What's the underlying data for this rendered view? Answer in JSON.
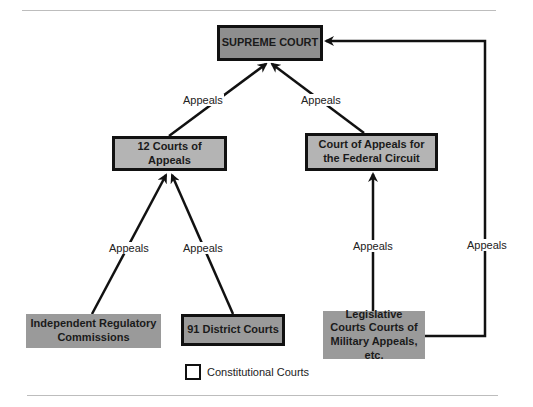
{
  "diagram": {
    "nodes": {
      "supreme": {
        "label": "SUPREME COURT",
        "constitutional": true
      },
      "courts_of_appeals": {
        "label": "12 Courts of Appeals",
        "constitutional": true
      },
      "federal_circuit": {
        "label": "Court of Appeals for the Federal Circuit",
        "constitutional": true
      },
      "regulatory": {
        "label": "Independent Regulatory Commissions",
        "constitutional": false
      },
      "district": {
        "label": "91 District Courts",
        "constitutional": true
      },
      "legislative": {
        "label": "Legislative Courts Courts of Military Appeals, etc.",
        "constitutional": false
      }
    },
    "edges": [
      {
        "from": "courts_of_appeals",
        "to": "supreme",
        "label": "Appeals"
      },
      {
        "from": "federal_circuit",
        "to": "supreme",
        "label": "Appeals"
      },
      {
        "from": "regulatory",
        "to": "courts_of_appeals",
        "label": "Appeals"
      },
      {
        "from": "district",
        "to": "courts_of_appeals",
        "label": "Appeals"
      },
      {
        "from": "legislative",
        "to": "federal_circuit",
        "label": "Appeals"
      },
      {
        "from": "legislative",
        "to": "supreme",
        "label": "Appeals"
      }
    ],
    "legend": {
      "label": "Constitutional Courts"
    },
    "colors": {
      "box_dark": "#8e8e8e",
      "box_light": "#b4b4b4",
      "border": "#111111"
    }
  }
}
